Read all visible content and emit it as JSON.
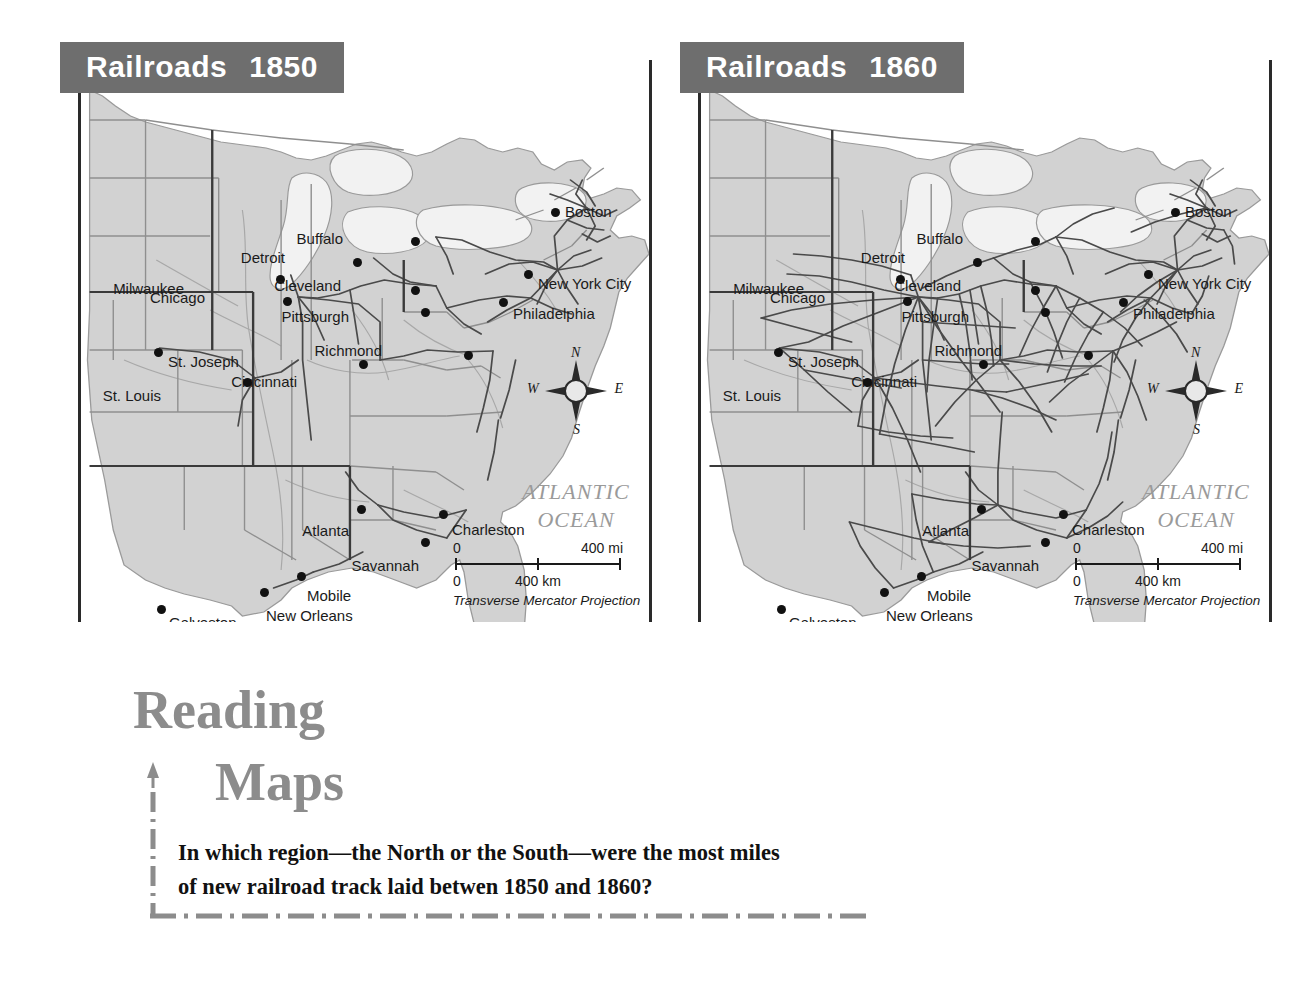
{
  "page": {
    "type": "textbook-map-spread",
    "background": "#ffffff"
  },
  "maps": [
    {
      "id": "railroads-1850",
      "title_word": "Railroads",
      "title_year": "1850",
      "ocean_line1": "ATLANTIC",
      "ocean_line2": "OCEAN",
      "projection": "Transverse Mercator Projection",
      "scale": {
        "mi_zero": "0",
        "mi_max": "400 mi",
        "km_zero": "0",
        "km_mid": "400 km"
      },
      "compass": {
        "n": "N",
        "e": "E",
        "s": "S",
        "w": "W"
      },
      "cities": [
        {
          "name": "Boston",
          "x": 470,
          "y": 148,
          "lx": 14,
          "ly": -14
        },
        {
          "name": "Buffalo",
          "x": 330,
          "y": 177,
          "lx": -68,
          "ly": -16
        },
        {
          "name": "Detroit",
          "x": 272,
          "y": 198,
          "lx": -68,
          "ly": -18
        },
        {
          "name": "New York City",
          "x": 443,
          "y": 210,
          "lx": 14,
          "ly": -4
        },
        {
          "name": "Milwaukee",
          "x": 195,
          "y": 215,
          "lx": -92,
          "ly": -4
        },
        {
          "name": "Chicago",
          "x": 202,
          "y": 237,
          "lx": -78,
          "ly": -17
        },
        {
          "name": "Cleveland",
          "x": 330,
          "y": 226,
          "lx": -70,
          "ly": -18
        },
        {
          "name": "Pittsburgh",
          "x": 340,
          "y": 248,
          "lx": -72,
          "ly": -9
        },
        {
          "name": "Philadelphia",
          "x": 418,
          "y": 238,
          "lx": 14,
          "ly": -2
        },
        {
          "name": "St. Joseph",
          "x": 73,
          "y": 288,
          "lx": 14,
          "ly": -4
        },
        {
          "name": "Richmond",
          "x": 383,
          "y": 291,
          "lx": -82,
          "ly": -18
        },
        {
          "name": "Cincinnati",
          "x": 278,
          "y": 300,
          "lx": -62,
          "ly": 4
        },
        {
          "name": "St. Louis",
          "x": 162,
          "y": 318,
          "lx": -82,
          "ly": 0
        },
        {
          "name": "Atlanta",
          "x": 276,
          "y": 445,
          "lx": -8,
          "ly": 8
        },
        {
          "name": "Charleston",
          "x": 358,
          "y": 450,
          "lx": 13,
          "ly": 2
        },
        {
          "name": "Savannah",
          "x": 340,
          "y": 478,
          "lx": -2,
          "ly": 10
        },
        {
          "name": "Mobile",
          "x": 216,
          "y": 512,
          "lx": 10,
          "ly": 6
        },
        {
          "name": "New Orleans",
          "x": 179,
          "y": 528,
          "lx": 6,
          "ly": 10
        },
        {
          "name": "Galveston",
          "x": 76,
          "y": 545,
          "lx": 12,
          "ly": 0
        }
      ],
      "network_density": "sparse"
    },
    {
      "id": "railroads-1860",
      "title_word": "Railroads",
      "title_year": "1860",
      "ocean_line1": "ATLANTIC",
      "ocean_line2": "OCEAN",
      "projection": "Transverse Mercator Projection",
      "scale": {
        "mi_zero": "0",
        "mi_max": "400 mi",
        "km_zero": "0",
        "km_mid": "400 km"
      },
      "compass": {
        "n": "N",
        "e": "E",
        "s": "S",
        "w": "W"
      },
      "cities": [
        {
          "name": "Boston",
          "x": 470,
          "y": 148,
          "lx": 14,
          "ly": -14
        },
        {
          "name": "Buffalo",
          "x": 330,
          "y": 177,
          "lx": -68,
          "ly": -16
        },
        {
          "name": "Detroit",
          "x": 272,
          "y": 198,
          "lx": -68,
          "ly": -18
        },
        {
          "name": "New York City",
          "x": 443,
          "y": 210,
          "lx": 14,
          "ly": -4
        },
        {
          "name": "Milwaukee",
          "x": 195,
          "y": 215,
          "lx": -92,
          "ly": -4
        },
        {
          "name": "Chicago",
          "x": 202,
          "y": 237,
          "lx": -78,
          "ly": -17
        },
        {
          "name": "Cleveland",
          "x": 330,
          "y": 226,
          "lx": -70,
          "ly": -18
        },
        {
          "name": "Pittsburgh",
          "x": 340,
          "y": 248,
          "lx": -72,
          "ly": -9
        },
        {
          "name": "Philadelphia",
          "x": 418,
          "y": 238,
          "lx": 14,
          "ly": -2
        },
        {
          "name": "St. Joseph",
          "x": 73,
          "y": 288,
          "lx": 14,
          "ly": -4
        },
        {
          "name": "Richmond",
          "x": 383,
          "y": 291,
          "lx": -82,
          "ly": -18
        },
        {
          "name": "Cincinnati",
          "x": 278,
          "y": 300,
          "lx": -62,
          "ly": 4
        },
        {
          "name": "St. Louis",
          "x": 162,
          "y": 318,
          "lx": -82,
          "ly": 0
        },
        {
          "name": "Atlanta",
          "x": 276,
          "y": 445,
          "lx": -8,
          "ly": 8
        },
        {
          "name": "Charleston",
          "x": 358,
          "y": 450,
          "lx": 13,
          "ly": 2
        },
        {
          "name": "Savannah",
          "x": 340,
          "y": 478,
          "lx": -2,
          "ly": 10
        },
        {
          "name": "Mobile",
          "x": 216,
          "y": 512,
          "lx": 10,
          "ly": 6
        },
        {
          "name": "New Orleans",
          "x": 179,
          "y": 528,
          "lx": 6,
          "ly": 10
        },
        {
          "name": "Galveston",
          "x": 76,
          "y": 545,
          "lx": 12,
          "ly": 0
        }
      ],
      "network_density": "dense"
    }
  ],
  "callout": {
    "heading_word1": "Reading",
    "heading_word2": "Maps",
    "question_line1": "In which region—the North or the South—were the most miles",
    "question_line2": "of new railroad track laid betwen 1850 and 1860?",
    "accent_color": "#8c8c8c"
  },
  "colors": {
    "banner_gray": "#6e6e6e",
    "land": "#d2d2d2",
    "water": "#ffffff",
    "rail": "#4a4a4a",
    "border": "#2a2a2a",
    "ocean_label": "#9a9a9a"
  }
}
